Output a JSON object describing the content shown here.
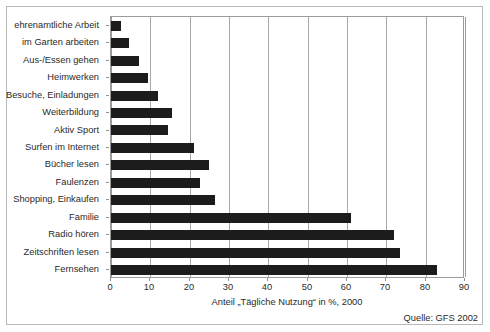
{
  "figure": {
    "axis_title": "Anteil „Tägliche Nutzung“ in %, 2000",
    "source": "Quelle: GFS 2002",
    "bar_color": "#1c1c1c",
    "grid_color": "#a8a8a8",
    "frame_color": "#b8b8b8"
  },
  "chart_data": {
    "type": "bar",
    "orientation": "horizontal",
    "title": "",
    "subtitle": "",
    "xlabel": "Anteil „Tägliche Nutzung“ in %, 2000",
    "ylabel": "",
    "xlim": [
      0,
      90
    ],
    "xticks": [
      0,
      10,
      20,
      30,
      40,
      50,
      60,
      70,
      80,
      90
    ],
    "xtick_labels": [
      "0",
      "10",
      "20",
      "30",
      "40",
      "50",
      "60",
      "70",
      "80",
      "90"
    ],
    "grid": true,
    "grid_axis": "x",
    "legend": false,
    "annotations": [
      "Quelle: GFS 2002"
    ],
    "categories": [
      "ehrenamtliche Arbeit",
      "im Garten arbeiten",
      "Aus-/Essen gehen",
      "Heimwerken",
      "Besuche, Einladungen",
      "Weiterbildung",
      "Aktiv Sport",
      "Surfen im Internet",
      "Bücher lesen",
      "Faulenzen",
      "Shopping, Einkaufen",
      "Familie",
      "Radio hören",
      "Zeitschriften lesen",
      "Fernsehen"
    ],
    "values": [
      2.5,
      4.5,
      7,
      9.5,
      12,
      15.5,
      14.5,
      21,
      25,
      22.5,
      26.5,
      61,
      72,
      73.5,
      83
    ]
  }
}
